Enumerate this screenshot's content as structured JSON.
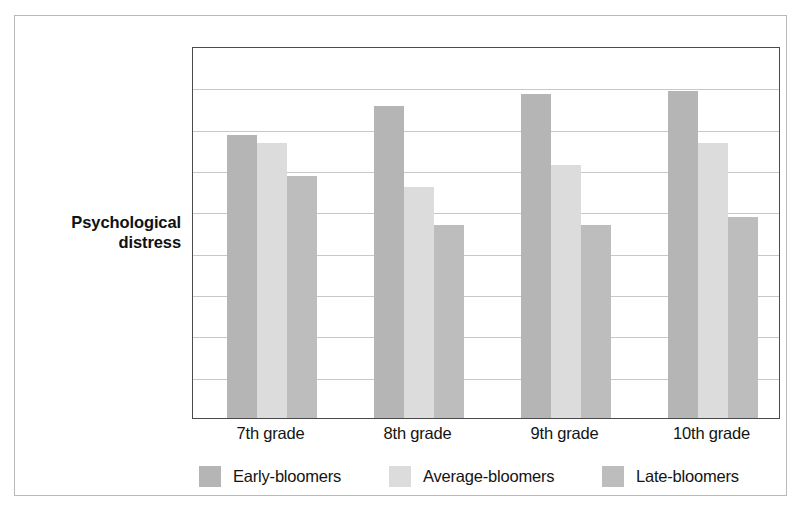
{
  "figure": {
    "y_axis_caption_lines": [
      "Psychological",
      "distress"
    ]
  },
  "chart_data": {
    "type": "bar",
    "title": "",
    "xlabel": "",
    "ylabel": "Psychological distress",
    "categories": [
      "7th grade",
      "8th grade",
      "9th grade",
      "10th grade"
    ],
    "series": [
      {
        "name": "Early-bloomers",
        "color": "#b5b5b5",
        "values": [
          7.6,
          8.4,
          8.7,
          8.8
        ]
      },
      {
        "name": "Average-bloomers",
        "color": "#dcdcdc",
        "values": [
          7.4,
          6.2,
          6.8,
          7.4
        ]
      },
      {
        "name": "Late-bloomers",
        "color": "#bdbdbd",
        "values": [
          6.5,
          5.2,
          5.2,
          5.4
        ]
      }
    ],
    "ylim": [
      0,
      10
    ],
    "yticks": [
      0,
      1.25,
      2.5,
      3.75,
      5,
      6.25,
      7.5,
      8.75,
      10
    ],
    "ytick_labels": [],
    "gridlines": 8,
    "grid": true,
    "legend_position": "bottom",
    "legend_entries": [
      "Early-bloomers",
      "Average-bloomers",
      "Late-bloomers"
    ]
  }
}
